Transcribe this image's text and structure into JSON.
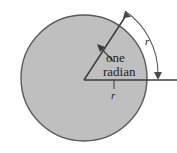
{
  "figure": {
    "background_color": "#ffffff",
    "circle_fill_color": "#bfbfbf",
    "stroke_color": "#4a4a4a",
    "text_color": "#1c1c1c",
    "labels": {
      "annotation_line1": "one",
      "annotation_line2": "radian",
      "radius_horizontal": "r",
      "arc_length": "r"
    },
    "geometry": {
      "center_x": 84,
      "center_y": 80,
      "radius": 63,
      "angle_degrees": 57.3,
      "arc_radius": 74
    }
  }
}
